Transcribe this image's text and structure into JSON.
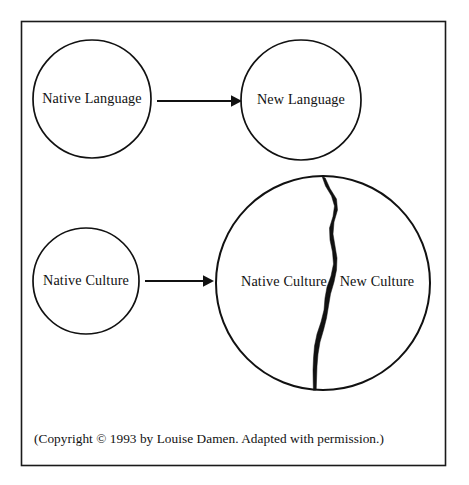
{
  "figure": {
    "frame": {
      "border_color": "#1a1a1a"
    },
    "nodes": {
      "native_language": "Native Language",
      "new_language": "New Language",
      "native_culture": "Native Culture",
      "split_native_culture": "Native Culture",
      "split_new_culture": "New Culture"
    },
    "arrows": {
      "language_arrow_label": "",
      "culture_arrow_label": ""
    },
    "caption": "(Copyright © 1993 by Louise Damen. Adapted with permission.)",
    "colors": {
      "ink": "#111111",
      "paper": "#ffffff"
    }
  }
}
